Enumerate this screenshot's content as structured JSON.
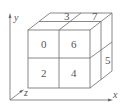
{
  "diagram": {
    "type": "2x2x2 cube subdivision",
    "axes": {
      "x": "x",
      "y": "y",
      "z": "z"
    },
    "front_face": [
      {
        "label": "0",
        "position": "top-left"
      },
      {
        "label": "6",
        "position": "top-right"
      },
      {
        "label": "2",
        "position": "bottom-left"
      },
      {
        "label": "4",
        "position": "bottom-right"
      }
    ],
    "top_face": [
      {
        "label": "3",
        "position": "back-left"
      },
      {
        "label": "7",
        "position": "back-right"
      }
    ],
    "right_face": [
      {
        "label": "5",
        "position": "back-bottom"
      }
    ],
    "colors": {
      "line": "#6a6a6a",
      "text": "#555555",
      "background": "#ffffff"
    }
  }
}
